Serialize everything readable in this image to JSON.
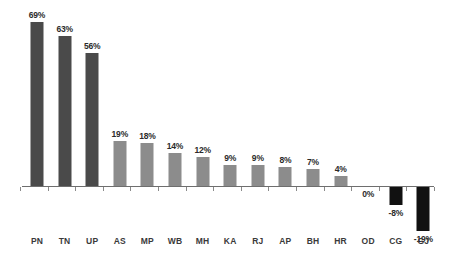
{
  "chart_data": {
    "type": "bar",
    "title": "",
    "subtitle": "",
    "xlabel": "",
    "ylabel": "",
    "categories": [
      "PN",
      "TN",
      "UP",
      "AS",
      "MP",
      "WB",
      "MH",
      "KA",
      "RJ",
      "AP",
      "BH",
      "HR",
      "OD",
      "CG",
      "GJ"
    ],
    "values": [
      69,
      63,
      56,
      19,
      18,
      14,
      12,
      9,
      9,
      8,
      7,
      4,
      0,
      -8,
      -19
    ],
    "value_labels": [
      "69%",
      "63%",
      "56%",
      "19%",
      "18%",
      "14%",
      "12%",
      "9%",
      "9%",
      "8%",
      "7%",
      "4%",
      "0%",
      "-8%",
      "-19%"
    ],
    "bar_colors": [
      "#4a4a4a",
      "#4a4a4a",
      "#4a4a4a",
      "#8c8c8c",
      "#8c8c8c",
      "#8c8c8c",
      "#8c8c8c",
      "#8c8c8c",
      "#8c8c8c",
      "#8c8c8c",
      "#8c8c8c",
      "#8c8c8c",
      "#8c8c8c",
      "#111111",
      "#111111"
    ],
    "color_groups": {
      "high": "#4a4a4a",
      "mid": "#8c8c8c",
      "negative": "#111111"
    },
    "ylim": [
      -19,
      69
    ],
    "grid": false,
    "legend": false,
    "legend_position": "none",
    "axis_color": "#6e6e6e",
    "background": "#ffffff",
    "units": "percent",
    "data_labels_shown": true
  }
}
